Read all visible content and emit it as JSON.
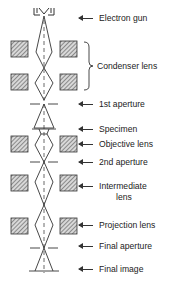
{
  "diagram": {
    "labels": {
      "electron_gun": "Electron gun",
      "condenser_lens": "Condenser lens",
      "first_aperture": "1st aperture",
      "specimen": "Specimen",
      "objective_lens": "Objective lens",
      "second_aperture": "2nd aperture",
      "intermediate_lens_line1": "Intermediate",
      "intermediate_lens_line2": "lens",
      "projection_lens": "Projection lens",
      "final_aperture": "Final aperture",
      "final_image": "Final image"
    },
    "colors": {
      "line": "#333333",
      "hatch": "#555555",
      "background": "#ffffff"
    }
  }
}
